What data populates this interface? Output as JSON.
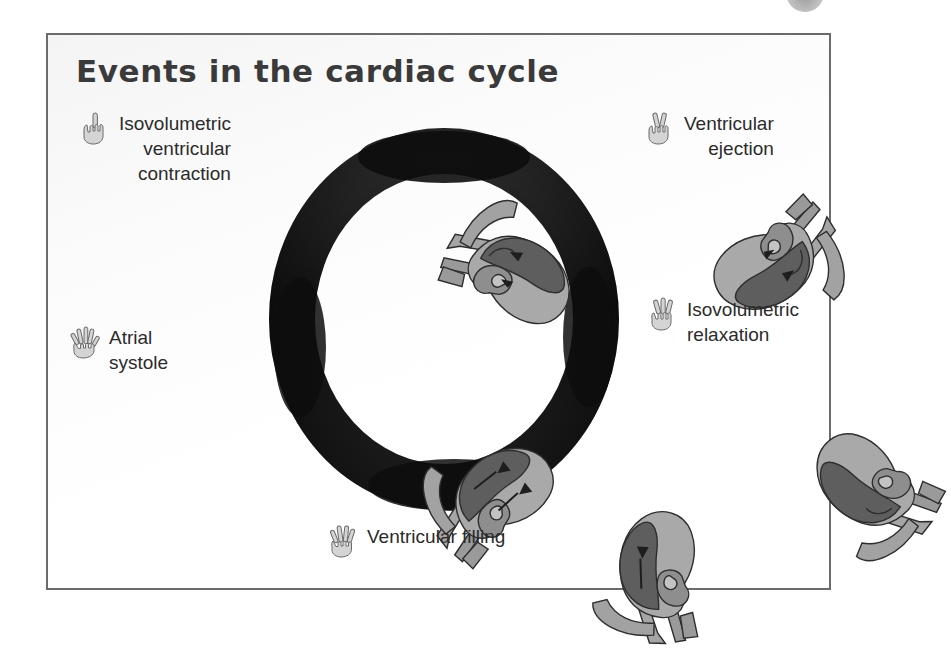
{
  "panel": {
    "title": "Events in the cardiac cycle",
    "border_color": "#6b6b6b",
    "background_color": "#ffffff"
  },
  "ring": {
    "color": "#1c1c1c",
    "description": "dark circular arrow band showing cycle direction (clockwise)",
    "stage_count": 5
  },
  "stages": [
    {
      "id": "isovolumetric-ventricular-contraction",
      "order": 1,
      "label": "Isovolumetric\nventricular\ncontraction",
      "hand_icon": "hand-one-finger-icon",
      "finger_count": 1,
      "position": "top-left"
    },
    {
      "id": "ventricular-ejection",
      "order": 2,
      "label": "Ventricular\nejection",
      "hand_icon": "hand-two-fingers-icon",
      "finger_count": 2,
      "position": "top-right"
    },
    {
      "id": "isovolumetric-relaxation",
      "order": 3,
      "label": "Isovolumetric\nrelaxation",
      "hand_icon": "hand-three-fingers-icon",
      "finger_count": 3,
      "position": "right"
    },
    {
      "id": "ventricular-filling",
      "order": 4,
      "label": "Ventricular filling",
      "hand_icon": "hand-four-fingers-icon",
      "finger_count": 4,
      "position": "bottom"
    },
    {
      "id": "atrial-systole",
      "order": 5,
      "label": "Atrial\nsystole",
      "hand_icon": "hand-five-fingers-icon",
      "finger_count": 5,
      "position": "left"
    }
  ],
  "heart_diagram": {
    "description": "grayscale cross-section of heart with chambers, great vessels and blood-flow arrows",
    "colors": {
      "myocardium_light": "#a9a9a9",
      "chamber_dark": "#5e5e5e",
      "vessel": "#9a9a9a",
      "outline": "#2e2e2e"
    },
    "instances": 5
  },
  "top_badge": {
    "shape": "partial-circle",
    "color": "#9a9a9a"
  }
}
